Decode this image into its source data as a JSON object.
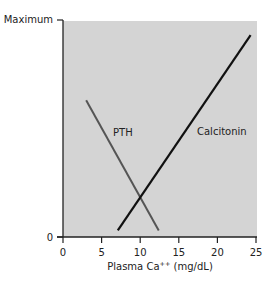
{
  "chart_data": {
    "type": "line",
    "title": "",
    "xlabel": "Plasma Ca++ (mg/dL)",
    "xlabel_main": "Plasma Ca",
    "xlabel_sup": "++",
    "xlabel_unit": " (mg/dL)",
    "ylabel": "",
    "xlim": [
      0,
      25
    ],
    "ylim": [
      0,
      100
    ],
    "x_ticks": [
      0,
      5,
      10,
      15,
      20,
      25
    ],
    "y_ticks": [
      "0",
      "Maximum"
    ],
    "grid": false,
    "background": "#d4d4d4",
    "series": [
      {
        "name": "PTH",
        "x": [
          3,
          12.4
        ],
        "y": [
          63,
          3
        ],
        "color": "#555555"
      },
      {
        "name": "Calcitonin",
        "x": [
          7.1,
          24.3
        ],
        "y": [
          3,
          93
        ],
        "color": "#111111"
      }
    ]
  },
  "axis": {
    "y_max_label": "Maximum",
    "y_zero_label": "0",
    "x_tick_labels": [
      "0",
      "5",
      "10",
      "15",
      "20",
      "25"
    ]
  },
  "labels": {
    "pth": "PTH",
    "calcitonin": "Calcitonin"
  }
}
